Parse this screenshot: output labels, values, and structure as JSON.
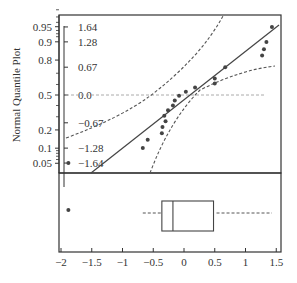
{
  "chart_data": [
    {
      "type": "scatter",
      "subtype": "normal-quantile-plot",
      "title": "",
      "ylabel": "Normal Quantile Plot",
      "xlabel": "",
      "left_axis_ticks": [
        "0.95",
        "0.9",
        "0.8",
        "0.5",
        "0.2",
        "0.1",
        "0.05"
      ],
      "left_axis_tick_values": [
        0.95,
        0.9,
        0.8,
        0.5,
        0.2,
        0.1,
        0.05
      ],
      "inner_axis_ticks": [
        "1.64",
        "1.28",
        "0.67",
        "0.0",
        "-0.67",
        "-1.28",
        "-1.64"
      ],
      "inner_axis_tick_values": [
        1.64,
        1.28,
        0.67,
        0.0,
        -0.67,
        -1.28,
        -1.64
      ],
      "x_ticks": [
        "-2",
        "-1.5",
        "-1",
        "-0.5",
        "0",
        "0.5",
        "1",
        "1.5"
      ],
      "xlim": [
        -2.05,
        1.6
      ],
      "ylim": [
        -2.1,
        2.15
      ],
      "reference_line": {
        "from": [
          -1.15,
          -2.1
        ],
        "to": [
          1.55,
          1.95
        ],
        "style": "solid"
      },
      "confidence_bands": "dashed curves",
      "zero_line": "dashed horizontal at normal quantile 0.0",
      "points": [
        {
          "x": -1.88,
          "y": -1.64
        },
        {
          "x": -0.67,
          "y": -1.28
        },
        {
          "x": -0.59,
          "y": -1.08
        },
        {
          "x": -0.36,
          "y": -0.92
        },
        {
          "x": -0.35,
          "y": -0.77
        },
        {
          "x": -0.3,
          "y": -0.63
        },
        {
          "x": -0.32,
          "y": -0.5
        },
        {
          "x": -0.26,
          "y": -0.37
        },
        {
          "x": -0.18,
          "y": -0.25
        },
        {
          "x": -0.15,
          "y": -0.13
        },
        {
          "x": -0.08,
          "y": -0.02
        },
        {
          "x": 0.03,
          "y": 0.08
        },
        {
          "x": 0.18,
          "y": 0.18
        },
        {
          "x": 0.5,
          "y": 0.28
        },
        {
          "x": 0.5,
          "y": 0.4
        },
        {
          "x": 0.67,
          "y": 0.67
        },
        {
          "x": 1.27,
          "y": 0.95
        },
        {
          "x": 1.3,
          "y": 1.1
        },
        {
          "x": 1.34,
          "y": 1.28
        },
        {
          "x": 1.43,
          "y": 1.64
        }
      ]
    },
    {
      "type": "boxplot",
      "orientation": "horizontal",
      "whisker_low": -0.67,
      "q1": -0.36,
      "median": -0.18,
      "q3": 0.48,
      "whisker_high": 1.43,
      "outliers": [
        -1.88
      ],
      "x_ticks": [
        "-2",
        "-1.5",
        "-1",
        "-0.5",
        "0",
        "0.5",
        "1",
        "1.5"
      ]
    }
  ],
  "labels": {
    "ylabel": "Normal Quantile Plot",
    "left_ticks": [
      "0.95",
      "0.9",
      "0.8",
      "0.5",
      "0.2",
      "0.1",
      "0.05"
    ],
    "inner_ticks": [
      "1.64",
      "1.28",
      "0.67",
      "0.0",
      "-0.67",
      "-1.28",
      "-1.64"
    ],
    "x_ticks": [
      "-2",
      "-1.5",
      "-1",
      "-0.5",
      "0",
      "0.5",
      "1",
      "1.5"
    ]
  },
  "colors": {
    "axis": "#333333",
    "points": "#444444",
    "reference_line": "#444444",
    "dashed": "#555555",
    "zero_line": "#aaaaaa"
  }
}
